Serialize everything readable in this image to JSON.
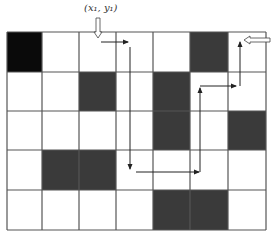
{
  "diagram": {
    "start_label": "(x₁, y₁)",
    "grid": {
      "rows": 5,
      "cols": 7,
      "x_lines": [
        7,
        42,
        79,
        116,
        153,
        190,
        228,
        266
      ],
      "y_lines": [
        32,
        72,
        111,
        150,
        190,
        230
      ],
      "line_color": "#555555"
    },
    "cells": [
      {
        "row": 0,
        "col": 0,
        "fill": "#0a0a0a"
      },
      {
        "row": 0,
        "col": 5,
        "fill": "#3a3a3a"
      },
      {
        "row": 1,
        "col": 2,
        "fill": "#3a3a3a"
      },
      {
        "row": 1,
        "col": 4,
        "fill": "#3a3a3a"
      },
      {
        "row": 2,
        "col": 4,
        "fill": "#3a3a3a"
      },
      {
        "row": 2,
        "col": 6,
        "fill": "#3a3a3a"
      },
      {
        "row": 3,
        "col": 1,
        "fill": "#3a3a3a"
      },
      {
        "row": 3,
        "col": 2,
        "fill": "#3a3a3a"
      },
      {
        "row": 4,
        "col": 4,
        "fill": "#3a3a3a"
      },
      {
        "row": 4,
        "col": 5,
        "fill": "#3a3a3a"
      }
    ],
    "path": [
      {
        "from": [
          101,
          42
        ],
        "to": [
          128,
          42
        ]
      },
      {
        "from": [
          130,
          47
        ],
        "to": [
          130,
          169
        ]
      },
      {
        "from": [
          136,
          172
        ],
        "to": [
          199,
          172
        ]
      },
      {
        "from": [
          200,
          172
        ],
        "to": [
          200,
          88
        ]
      },
      {
        "from": [
          200,
          86
        ],
        "to": [
          236,
          86
        ]
      },
      {
        "from": [
          240,
          86
        ],
        "to": [
          240,
          42
        ]
      }
    ],
    "start_arrow": {
      "x": 98,
      "y_from": 18,
      "y_to": 38
    },
    "end_arrow": {
      "y": 40,
      "x_from": 270,
      "x_to": 244
    },
    "path_color": "#222222"
  }
}
